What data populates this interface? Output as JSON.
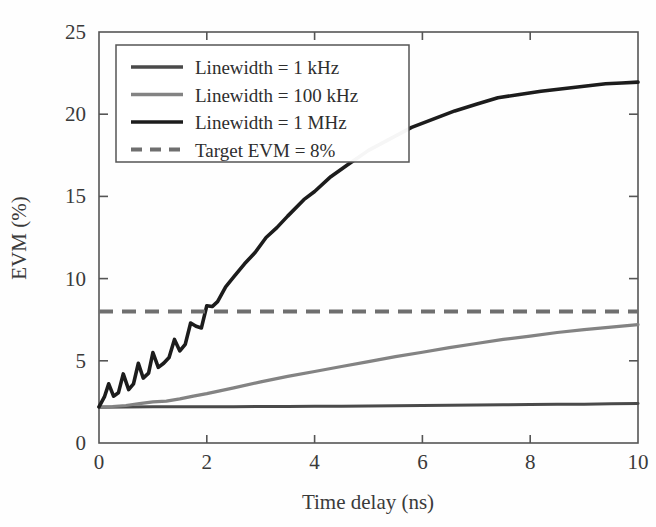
{
  "figure": {
    "background_color": "#fefefe",
    "frame_color": "#555555",
    "plot_box_px": {
      "left": 99,
      "right": 638,
      "top": 32,
      "bottom": 443
    }
  },
  "chart_data": {
    "type": "line",
    "title": "",
    "xlabel": "Time delay (ns)",
    "ylabel": "EVM (%)",
    "xlim": [
      0,
      10
    ],
    "ylim": [
      0,
      25
    ],
    "xticks": [
      0,
      2,
      4,
      6,
      8,
      10
    ],
    "yticks": [
      0,
      5,
      10,
      15,
      20,
      25
    ],
    "xtick_labels": [
      "0",
      "2",
      "4",
      "6",
      "8",
      "10"
    ],
    "ytick_labels": [
      "0",
      "5",
      "10",
      "15",
      "20",
      "25"
    ],
    "grid": false,
    "legend_position": "upper-left-inside",
    "series": [
      {
        "name": "Linewidth = 1 kHz",
        "color": "#4a4a4a",
        "style": "solid",
        "width": 3.0,
        "x": [
          0.0,
          0.5,
          1.0,
          1.5,
          2.0,
          2.5,
          3.0,
          3.5,
          4.0,
          4.5,
          5.0,
          5.5,
          6.0,
          6.5,
          7.0,
          7.5,
          8.0,
          8.5,
          9.0,
          9.5,
          10.0
        ],
        "values": [
          2.18,
          2.19,
          2.2,
          2.2,
          2.21,
          2.21,
          2.22,
          2.22,
          2.23,
          2.24,
          2.25,
          2.26,
          2.28,
          2.3,
          2.31,
          2.33,
          2.34,
          2.35,
          2.36,
          2.38,
          2.4
        ]
      },
      {
        "name": "Linewidth = 100 kHz",
        "color": "#838383",
        "style": "solid",
        "width": 3.2,
        "x": [
          0.0,
          0.25,
          0.5,
          0.75,
          1.0,
          1.25,
          1.5,
          1.75,
          2.0,
          2.5,
          3.0,
          3.5,
          4.0,
          4.5,
          5.0,
          5.5,
          6.0,
          6.5,
          7.0,
          7.5,
          8.0,
          8.5,
          9.0,
          9.5,
          10.0
        ],
        "values": [
          2.2,
          2.22,
          2.28,
          2.4,
          2.5,
          2.55,
          2.68,
          2.85,
          3.0,
          3.35,
          3.72,
          4.05,
          4.35,
          4.65,
          4.95,
          5.25,
          5.52,
          5.8,
          6.05,
          6.3,
          6.5,
          6.72,
          6.9,
          7.05,
          7.2
        ]
      },
      {
        "name": "Linewidth = 1 MHz",
        "color": "#1c1c1c",
        "style": "solid",
        "width": 3.6,
        "x": [
          0.0,
          0.1,
          0.18,
          0.27,
          0.36,
          0.45,
          0.55,
          0.64,
          0.73,
          0.82,
          0.92,
          1.0,
          1.1,
          1.2,
          1.3,
          1.4,
          1.5,
          1.6,
          1.7,
          1.8,
          1.9,
          2.0,
          2.1,
          2.2,
          2.35,
          2.5,
          2.7,
          2.9,
          3.1,
          3.3,
          3.5,
          3.8,
          4.0,
          4.3,
          4.6,
          5.0,
          5.4,
          5.8,
          6.2,
          6.6,
          7.0,
          7.4,
          7.8,
          8.2,
          8.6,
          9.0,
          9.4,
          9.7,
          10.0
        ],
        "values": [
          2.2,
          2.8,
          3.6,
          2.85,
          3.05,
          4.2,
          3.25,
          3.6,
          4.85,
          3.95,
          4.25,
          5.5,
          4.6,
          4.85,
          5.2,
          6.3,
          5.6,
          6.0,
          7.3,
          7.1,
          7.0,
          8.35,
          8.3,
          8.6,
          9.5,
          10.1,
          10.9,
          11.6,
          12.5,
          13.1,
          13.8,
          14.8,
          15.3,
          16.2,
          16.9,
          17.8,
          18.5,
          19.2,
          19.7,
          20.2,
          20.6,
          21.0,
          21.2,
          21.4,
          21.55,
          21.7,
          21.85,
          21.9,
          21.95
        ]
      }
    ],
    "reference_line": {
      "name": "Target EVM = 8%",
      "value": 8,
      "orientation": "horizontal",
      "color": "#6f6f6f",
      "style": "dashed",
      "width": 4.2
    }
  },
  "legend": {
    "entries": [
      {
        "label": "Linewidth = 1 kHz",
        "color": "#4a4a4a",
        "style": "solid"
      },
      {
        "label": "Linewidth = 100 kHz",
        "color": "#838383",
        "style": "solid"
      },
      {
        "label": "Linewidth = 1 MHz",
        "color": "#1c1c1c",
        "style": "solid"
      },
      {
        "label": "Target EVM = 8%",
        "color": "#6f6f6f",
        "style": "dashed"
      }
    ]
  }
}
